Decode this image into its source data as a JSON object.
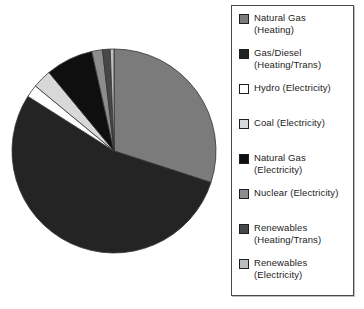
{
  "figure": {
    "kind": "scanned textbook pie chart figure",
    "background_color": "#ffffff",
    "legend_border_color": "#4a4a4a",
    "text_color": "#1c1c1c"
  },
  "chart_data": {
    "type": "pie",
    "title": "",
    "legend_position": "right",
    "start_angle": "12 o'clock",
    "direction": "clockwise",
    "units": "percent (estimated from slice angles)",
    "slices": [
      {
        "key": "natural-gas-heating",
        "label": "Natural Gas (Heating)",
        "label_line1": "Natural Gas",
        "label_line2": "(Heating)",
        "value": 30.0,
        "color": "#7b7b7b"
      },
      {
        "key": "gas-diesel-heating-trans",
        "label": "Gas/Diesel (Heating/Trans)",
        "label_line1": "Gas/Diesel",
        "label_line2": "(Heating/Trans)",
        "value": 54.0,
        "color": "#242424"
      },
      {
        "key": "hydro-electricity",
        "label": "Hydro (Electricity)",
        "label_line1": "Hydro (Electricity)",
        "label_line2": "",
        "value": 2.0,
        "color": "#fdfdfd"
      },
      {
        "key": "coal-electricity",
        "label": "Coal (Electricity)",
        "label_line1": "Coal (Electricity)",
        "label_line2": "",
        "value": 3.0,
        "color": "#d8d8d8"
      },
      {
        "key": "natural-gas-electricity",
        "label": "Natural Gas (Electricity)",
        "label_line1": "Natural Gas",
        "label_line2": "(Electricity)",
        "value": 7.5,
        "color": "#0f0f0f"
      },
      {
        "key": "nuclear-electricity",
        "label": "Nuclear (Electricity)",
        "label_line1": "Nuclear (Electricity)",
        "label_line2": "",
        "value": 1.7,
        "color": "#8d8d8d"
      },
      {
        "key": "renewables-heating-trans",
        "label": "Renewables (Heating/Trans)",
        "label_line1": "Renewables",
        "label_line2": "(Heating/Trans)",
        "value": 1.2,
        "color": "#474747"
      },
      {
        "key": "renewables-electricity",
        "label": "Renewables (Electricity)",
        "label_line1": "Renewables",
        "label_line2": "(Electricity)",
        "value": 0.6,
        "color": "#bdbdbd"
      }
    ]
  }
}
